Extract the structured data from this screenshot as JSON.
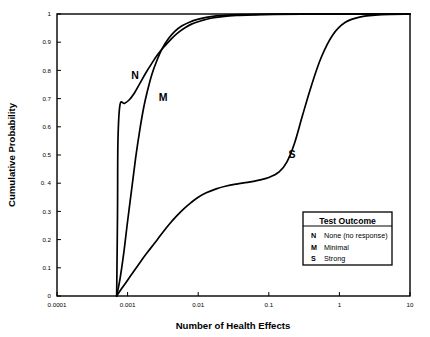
{
  "chart_data": {
    "type": "line",
    "title": "",
    "xlabel": "Number of Health Effects",
    "ylabel": "Cumulative Probability",
    "xscale": "log",
    "yscale": "linear",
    "xlim": [
      0.0001,
      10
    ],
    "ylim": [
      0,
      1
    ],
    "grid": false,
    "xticks": [
      "0.0001",
      "0.001",
      "0.01",
      "0.1",
      "1",
      "10"
    ],
    "xtick_values": [
      0.0001,
      0.001,
      0.01,
      0.1,
      1,
      10
    ],
    "yticks": [
      "0",
      "0.1",
      "0.2",
      "0.3",
      "0. 4",
      "0.5",
      "0.6",
      "0.7",
      "0.8",
      "0.9",
      "1"
    ],
    "ytick_values": [
      0,
      0.1,
      0.2,
      0.3,
      0.4,
      0.5,
      0.6,
      0.7,
      0.8,
      0.9,
      1.0
    ],
    "legend_position": "lower right",
    "series": [
      {
        "name": "N",
        "label": "N",
        "legend_key": "N",
        "legend_description": "None (no response)",
        "color": "#000000",
        "x": [
          0.0007,
          0.00072,
          0.00073,
          0.00078,
          0.0009,
          0.00105,
          0.00125,
          0.0015,
          0.0018,
          0.0022,
          0.0027,
          0.0034,
          0.0042,
          0.0052,
          0.0065,
          0.0082,
          0.011,
          0.015,
          0.022,
          0.035,
          0.06,
          0.12,
          0.4,
          1.5,
          10
        ],
        "y": [
          0.0,
          0.3,
          0.55,
          0.678,
          0.683,
          0.695,
          0.72,
          0.755,
          0.79,
          0.825,
          0.858,
          0.888,
          0.913,
          0.934,
          0.951,
          0.965,
          0.976,
          0.985,
          0.991,
          0.995,
          0.997,
          0.9985,
          0.9995,
          1.0,
          1.0
        ]
      },
      {
        "name": "M",
        "label": "M",
        "legend_key": "M",
        "legend_description": "Minimal",
        "color": "#000000",
        "x": [
          0.0007,
          0.00078,
          0.00088,
          0.001,
          0.00115,
          0.0013,
          0.00148,
          0.00168,
          0.0019,
          0.0022,
          0.0026,
          0.0031,
          0.0038,
          0.0047,
          0.0059,
          0.0075,
          0.0098,
          0.013,
          0.018,
          0.026,
          0.04,
          0.07,
          0.15,
          0.5,
          2.0,
          10
        ],
        "y": [
          0.0,
          0.06,
          0.15,
          0.265,
          0.385,
          0.49,
          0.585,
          0.665,
          0.725,
          0.785,
          0.835,
          0.878,
          0.913,
          0.939,
          0.958,
          0.971,
          0.981,
          0.988,
          0.993,
          0.996,
          0.998,
          0.999,
          0.9996,
          0.9999,
          1.0,
          1.0
        ]
      },
      {
        "name": "S",
        "label": "S",
        "legend_key": "S",
        "legend_description": "Strong",
        "color": "#000000",
        "x": [
          0.0007,
          0.0008,
          0.00095,
          0.00115,
          0.0014,
          0.0017,
          0.0021,
          0.0026,
          0.0032,
          0.004,
          0.005,
          0.0063,
          0.008,
          0.01,
          0.013,
          0.018,
          0.025,
          0.035,
          0.05,
          0.07,
          0.1,
          0.14,
          0.18,
          0.23,
          0.3,
          0.4,
          0.55,
          0.8,
          1.2,
          2.0,
          4.0,
          10
        ],
        "y": [
          0.0,
          0.022,
          0.048,
          0.078,
          0.108,
          0.138,
          0.168,
          0.198,
          0.228,
          0.258,
          0.285,
          0.31,
          0.332,
          0.35,
          0.366,
          0.38,
          0.39,
          0.397,
          0.403,
          0.41,
          0.42,
          0.44,
          0.475,
          0.54,
          0.64,
          0.745,
          0.845,
          0.925,
          0.97,
          0.99,
          0.998,
          1.0
        ]
      }
    ],
    "curve_annotations": [
      {
        "text": "N",
        "x_px": 135,
        "y_px": 79
      },
      {
        "text": "M",
        "x_px": 163,
        "y_px": 101
      },
      {
        "text": "S",
        "x_px": 292,
        "y_px": 158
      }
    ],
    "legend": {
      "title": "Test Outcome",
      "entries": [
        {
          "key": "N",
          "description": "None (no response)"
        },
        {
          "key": "M",
          "description": "Minimal"
        },
        {
          "key": "S",
          "description": "Strong"
        }
      ]
    }
  }
}
